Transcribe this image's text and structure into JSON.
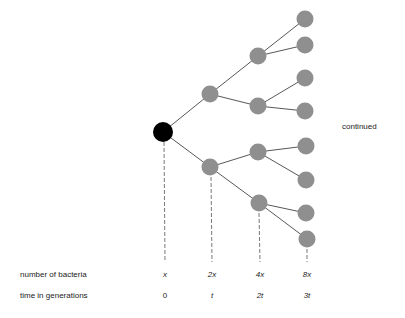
{
  "diagram": {
    "continued_label": "continued",
    "row_labels": {
      "number": "number of bacteria",
      "time": "time in generations"
    },
    "columns": [
      {
        "count": "x",
        "time": "0"
      },
      {
        "count": "2x",
        "time": "t"
      },
      {
        "count": "4x",
        "time": "2t"
      },
      {
        "count": "8x",
        "time": "3t"
      }
    ],
    "colors": {
      "root": "#000000",
      "cell": "#8f8f8f",
      "line": "#444444"
    },
    "nodes": [
      {
        "id": "g0",
        "gen": 0,
        "x": 163,
        "y": 132
      },
      {
        "id": "g1a",
        "gen": 1,
        "x": 210,
        "y": 94
      },
      {
        "id": "g1b",
        "gen": 1,
        "x": 210,
        "y": 167
      },
      {
        "id": "g2a",
        "gen": 2,
        "x": 258,
        "y": 56
      },
      {
        "id": "g2b",
        "gen": 2,
        "x": 258,
        "y": 106
      },
      {
        "id": "g2c",
        "gen": 2,
        "x": 258,
        "y": 152
      },
      {
        "id": "g2d",
        "gen": 2,
        "x": 259,
        "y": 203
      },
      {
        "id": "g3a",
        "gen": 3,
        "x": 305,
        "y": 19
      },
      {
        "id": "g3b",
        "gen": 3,
        "x": 305,
        "y": 45
      },
      {
        "id": "g3c",
        "gen": 3,
        "x": 305,
        "y": 78
      },
      {
        "id": "g3d",
        "gen": 3,
        "x": 305,
        "y": 111
      },
      {
        "id": "g3e",
        "gen": 3,
        "x": 306,
        "y": 146
      },
      {
        "id": "g3f",
        "gen": 3,
        "x": 306,
        "y": 180
      },
      {
        "id": "g3g",
        "gen": 3,
        "x": 306,
        "y": 213
      },
      {
        "id": "g3h",
        "gen": 3,
        "x": 307,
        "y": 239
      }
    ]
  }
}
